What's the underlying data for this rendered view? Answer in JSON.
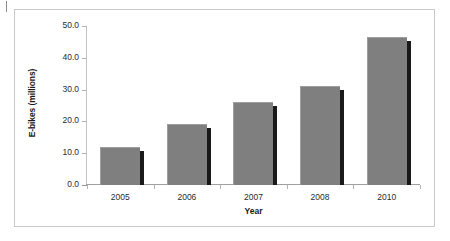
{
  "chart_data": {
    "type": "bar",
    "title": "",
    "categories": [
      "2005",
      "2006",
      "2007",
      "2008",
      "2010"
    ],
    "values": [
      12.0,
      19.2,
      26.0,
      31.1,
      46.5
    ],
    "series": [
      {
        "name": "E-bikes (millions)",
        "values": [
          12.0,
          19.2,
          26.0,
          31.1,
          46.5
        ]
      }
    ],
    "xlabel": "Year",
    "ylabel": "E-bikes (millions)",
    "ylim": [
      0.0,
      50.0
    ],
    "ytick_labels": [
      "50.0",
      "40.0",
      "30.0",
      "20.0",
      "10.0",
      "0.0"
    ],
    "ytick_values": [
      50.0,
      40.0,
      30.0,
      20.0,
      10.0,
      0.0
    ],
    "ytick_step": 10.0,
    "grid": false,
    "legend": "none",
    "bar_color": "#7f7f7f",
    "bar_shadow_color": "#1a1a1a",
    "axis_color": "#b4b4b4",
    "frame_color": "#c8c8c8",
    "background": "#ffffff"
  }
}
